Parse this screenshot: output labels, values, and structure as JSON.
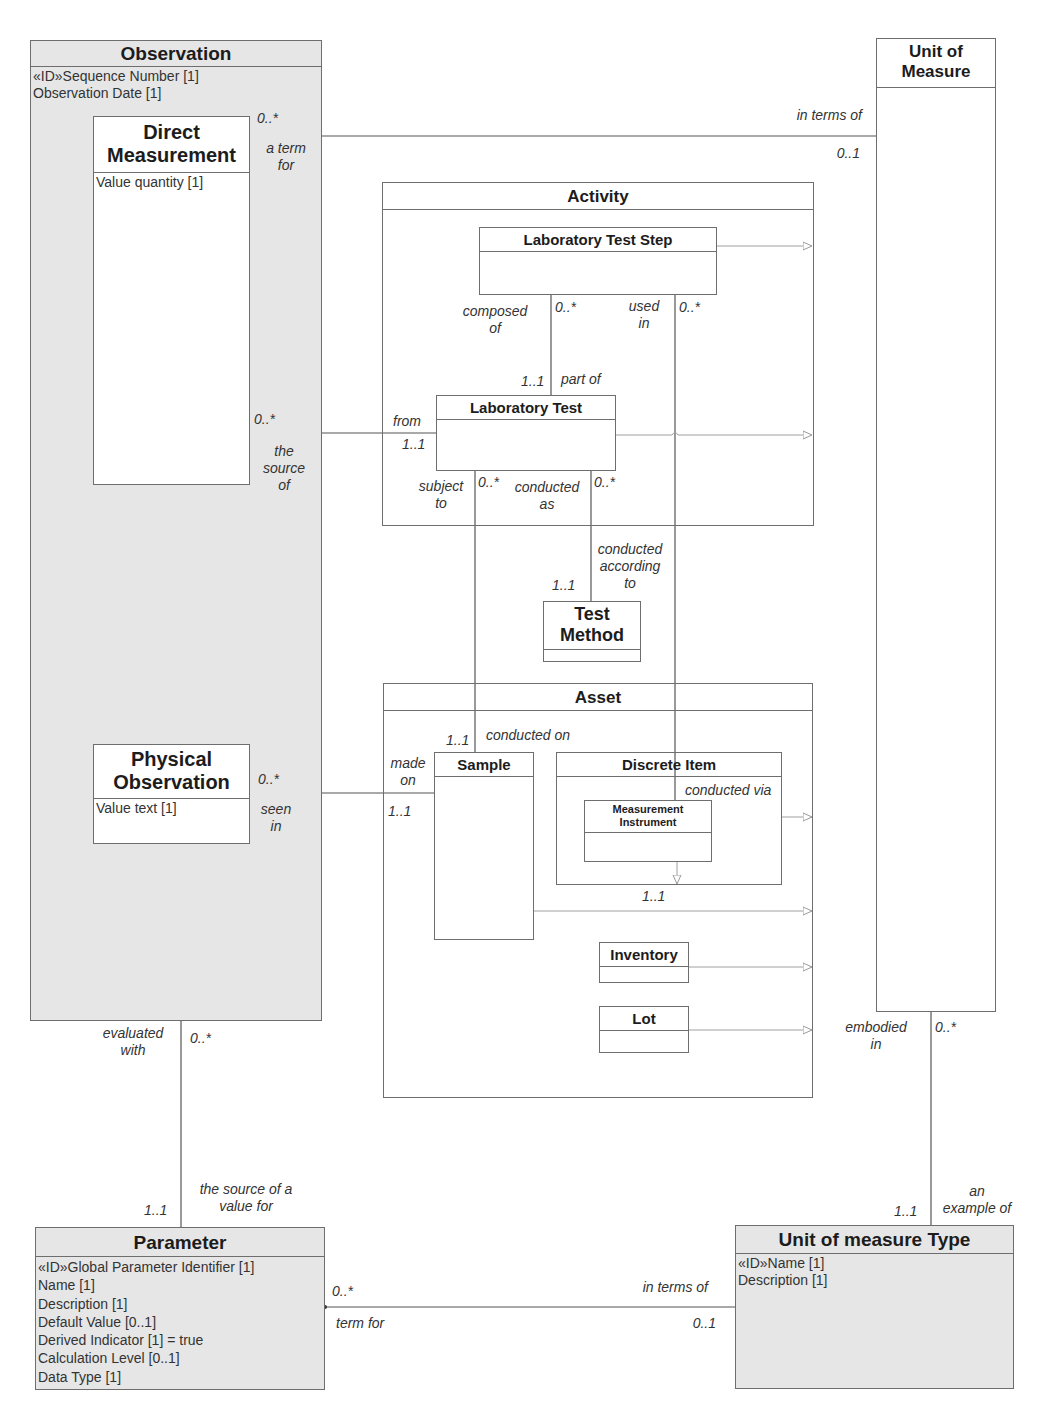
{
  "classes": {
    "observation": {
      "name": "Observation",
      "attributes": [
        "«ID»Sequence Number [1]",
        "Observation Date [1]"
      ]
    },
    "direct_measurement": {
      "name_line1": "Direct",
      "name_line2": "Measurement",
      "attributes": [
        "Value quantity [1]"
      ]
    },
    "physical_observation": {
      "name_line1": "Physical",
      "name_line2": "Observation",
      "attributes": [
        "Value text [1]"
      ]
    },
    "unit_of_measure": {
      "name_line1": "Unit of",
      "name_line2": "Measure"
    },
    "activity": {
      "name": "Activity"
    },
    "laboratory_test_step": {
      "name": "Laboratory Test Step"
    },
    "laboratory_test": {
      "name": "Laboratory Test"
    },
    "test_method": {
      "name_line1": "Test",
      "name_line2": "Method"
    },
    "asset": {
      "name": "Asset"
    },
    "sample": {
      "name": "Sample"
    },
    "discrete_item": {
      "name": "Discrete Item"
    },
    "measurement_instrument": {
      "name_line1": "Measurement",
      "name_line2": "Instrument"
    },
    "inventory": {
      "name": "Inventory"
    },
    "lot": {
      "name": "Lot"
    },
    "parameter": {
      "name": "Parameter",
      "attributes": [
        "«ID»Global Parameter Identifier [1]",
        "Name [1]",
        "Description [1]",
        "Default Value [0..1]",
        "Derived Indicator [1] = true",
        "Calculation Level [0..1]",
        "Data Type [1]"
      ]
    },
    "unit_of_measure_type": {
      "name": "Unit of measure Type",
      "attributes": [
        "«ID»Name [1]",
        "Description [1]"
      ]
    }
  },
  "associations": {
    "dm_uom": {
      "near_mult": "0..*",
      "near_role_1": "a term",
      "near_role_2": "for",
      "far_role": "in terms of",
      "far_mult": "0..1"
    },
    "dm_labtest": {
      "near_mult": "0..*",
      "near_role_1": "the",
      "near_role_2": "source",
      "near_role_3": "of",
      "far_role": "from",
      "far_mult": "1..1"
    },
    "step_labtest": {
      "role_1": "composed",
      "role_2": "of",
      "top_mult": "0..*",
      "bottom_mult": "1..1",
      "bottom_role": "part of"
    },
    "step_instrument": {
      "role_1": "used",
      "role_2": "in",
      "top_mult": "0..*",
      "bottom_role": "conducted via",
      "bottom_mult": "1..1"
    },
    "labtest_sample": {
      "role_1": "subject",
      "role_2": "to",
      "top_mult": "0..*",
      "bottom_mult": "1..1",
      "bottom_role": "conducted on"
    },
    "labtest_method": {
      "role_1": "conducted",
      "role_2": "as",
      "top_mult": "0..*",
      "bottom_role_1": "conducted",
      "bottom_role_2": "according",
      "bottom_role_3": "to",
      "bottom_mult": "1..1"
    },
    "po_sample": {
      "near_mult": "0..*",
      "near_role_1": "seen",
      "near_role_2": "in",
      "far_role_1": "made",
      "far_role_2": "on",
      "far_mult": "1..1"
    },
    "obs_param": {
      "role_1": "evaluated",
      "role_2": "with",
      "top_mult": "0..*",
      "bottom_mult": "1..1",
      "bottom_role_1": "the source of a",
      "bottom_role_2": "value for"
    },
    "uom_type": {
      "role_1": "embodied",
      "role_2": "in",
      "top_mult": "0..*",
      "bottom_mult": "1..1",
      "bottom_role_1": "an",
      "bottom_role_2": "example of"
    },
    "param_uomtype": {
      "near_mult": "0..*",
      "near_role": "term for",
      "far_role": "in terms of",
      "far_mult": "0..1"
    }
  },
  "colors": {
    "shaded_fill": "#e6e6e6",
    "line": "#6e6e6e",
    "generalization_line": "#a0a0a0"
  }
}
